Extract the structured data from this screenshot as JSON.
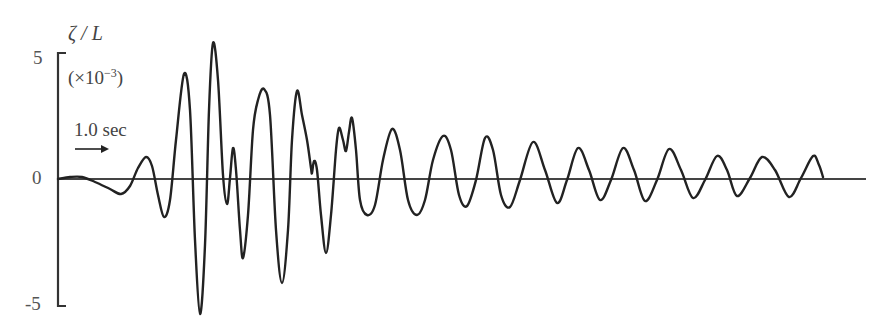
{
  "chart_data": {
    "type": "line",
    "title": "",
    "ylabel": "ζ / L",
    "y_unit": "(×10^-3)",
    "y_unit_base": "(×10",
    "y_unit_exp": "−3",
    "y_unit_close": ")",
    "xlabel": "",
    "ylim": [
      -5,
      5
    ],
    "yticks": [
      "5",
      "0",
      "-5"
    ],
    "grid": false,
    "legend": null,
    "annotation": {
      "text": "1.0 sec",
      "arrow": "right"
    },
    "series": [
      {
        "name": "ζ/L",
        "points_px": [
          [
            58,
            179
          ],
          [
            70,
            177
          ],
          [
            82,
            177
          ],
          [
            95,
            182
          ],
          [
            110,
            189
          ],
          [
            121,
            194
          ],
          [
            130,
            186
          ],
          [
            138,
            168
          ],
          [
            146,
            157
          ],
          [
            152,
            166
          ],
          [
            158,
            195
          ],
          [
            164,
            217
          ],
          [
            170,
            200
          ],
          [
            176,
            140
          ],
          [
            184,
            74
          ],
          [
            190,
            110
          ],
          [
            195,
            240
          ],
          [
            200,
            314
          ],
          [
            205,
            245
          ],
          [
            209,
            110
          ],
          [
            213,
            43
          ],
          [
            218,
            80
          ],
          [
            223,
            175
          ],
          [
            227,
            204
          ],
          [
            230,
            178
          ],
          [
            233,
            148
          ],
          [
            236,
            170
          ],
          [
            240,
            230
          ],
          [
            243,
            258
          ],
          [
            248,
            215
          ],
          [
            253,
            130
          ],
          [
            258,
            100
          ],
          [
            264,
            89
          ],
          [
            270,
            115
          ],
          [
            276,
            230
          ],
          [
            282,
            283
          ],
          [
            288,
            230
          ],
          [
            292,
            140
          ],
          [
            297,
            91
          ],
          [
            302,
            115
          ],
          [
            307,
            140
          ],
          [
            311,
            168
          ],
          [
            312,
            173
          ],
          [
            314,
            161
          ],
          [
            317,
            170
          ],
          [
            321,
            215
          ],
          [
            326,
            253
          ],
          [
            331,
            215
          ],
          [
            336,
            150
          ],
          [
            339,
            128
          ],
          [
            343,
            140
          ],
          [
            346,
            151
          ],
          [
            349,
            132
          ],
          [
            352,
            118
          ],
          [
            356,
            150
          ],
          [
            360,
            200
          ],
          [
            367,
            215
          ],
          [
            375,
            205
          ],
          [
            383,
            160
          ],
          [
            392,
            129
          ],
          [
            400,
            150
          ],
          [
            408,
            200
          ],
          [
            417,
            215
          ],
          [
            425,
            200
          ],
          [
            433,
            160
          ],
          [
            443,
            136
          ],
          [
            451,
            150
          ],
          [
            459,
            195
          ],
          [
            467,
            206
          ],
          [
            476,
            180
          ],
          [
            485,
            138
          ],
          [
            493,
            150
          ],
          [
            501,
            195
          ],
          [
            510,
            207
          ],
          [
            520,
            180
          ],
          [
            533,
            142
          ],
          [
            545,
            170
          ],
          [
            557,
            203
          ],
          [
            567,
            180
          ],
          [
            578,
            148
          ],
          [
            589,
            170
          ],
          [
            600,
            200
          ],
          [
            611,
            180
          ],
          [
            623,
            148
          ],
          [
            634,
            170
          ],
          [
            645,
            201
          ],
          [
            657,
            180
          ],
          [
            669,
            149
          ],
          [
            681,
            170
          ],
          [
            693,
            198
          ],
          [
            705,
            180
          ],
          [
            717,
            156
          ],
          [
            727,
            170
          ],
          [
            737,
            196
          ],
          [
            750,
            178
          ],
          [
            762,
            157
          ],
          [
            775,
            170
          ],
          [
            789,
            197
          ],
          [
            801,
            178
          ],
          [
            813,
            156
          ],
          [
            819,
            165
          ],
          [
            823,
            177
          ]
        ],
        "approx_values_x10e-3": {
          "peaks": [
            0.9,
            4.2,
            5.4,
            1.2,
            3.6,
            3.5,
            0.7,
            2.0,
            2.4,
            2.0,
            1.7,
            1.6,
            1.4,
            1.2,
            1.2,
            1.2,
            0.9,
            0.9,
            0.9
          ],
          "troughs": [
            -0.6,
            -1.5,
            -5.4,
            -1.0,
            -3.2,
            -4.2,
            -3.0,
            -1.5,
            -1.5,
            -1.1,
            -1.2,
            -1.0,
            -0.9,
            -0.9,
            -0.8,
            -0.7,
            -0.7
          ]
        }
      }
    ],
    "axis_px": {
      "x_axis_y": 179,
      "x_axis_start": 58,
      "x_axis_end": 866,
      "y_axis_x": 58,
      "y_top": 53,
      "y_bottom": 306
    }
  }
}
